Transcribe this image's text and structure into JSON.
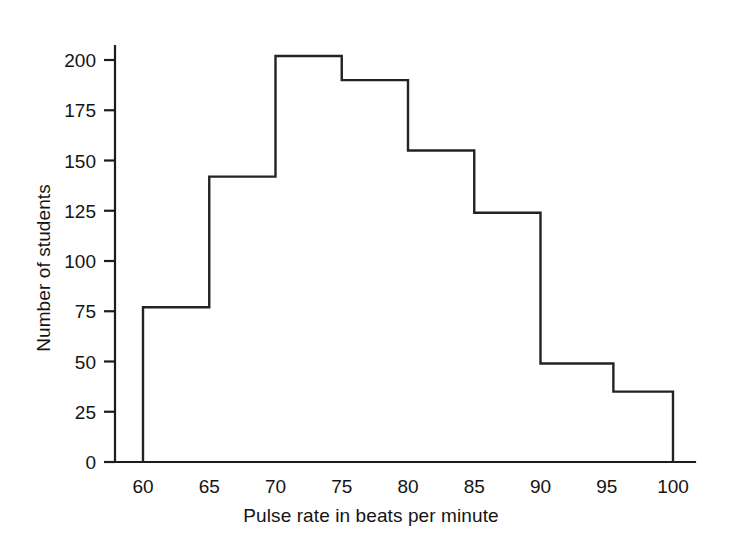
{
  "chart_data": {
    "type": "bar",
    "title": "",
    "subtitle": "",
    "xlabel": "Pulse rate in beats per minute",
    "ylabel": "Number of students",
    "style": "histogram-outline",
    "grid": false,
    "legend": null,
    "xlim": [
      57,
      103
    ],
    "ylim": [
      0,
      210
    ],
    "xticks": [
      60,
      65,
      70,
      75,
      80,
      85,
      90,
      95,
      100
    ],
    "xtick_labels": [
      "60",
      "65",
      "70",
      "75",
      "80",
      "85",
      "90",
      "95",
      "100"
    ],
    "yticks": [
      0,
      25,
      50,
      75,
      100,
      125,
      150,
      175,
      200
    ],
    "ytick_labels": [
      "0",
      "25",
      "50",
      "75",
      "100",
      "125",
      "150",
      "175",
      "200"
    ],
    "bin_edges": [
      60,
      65,
      70,
      75,
      80,
      85,
      90,
      95.5,
      100
    ],
    "categories": [
      "60-65",
      "65-70",
      "70-75",
      "75-80",
      "80-85",
      "85-90",
      "90-95.5",
      "95.5-100"
    ],
    "values": [
      77,
      142,
      202,
      190,
      155,
      124,
      49,
      35
    ],
    "line_color": "#232323",
    "fill_color": "none",
    "axis_color": "#1c1c1c"
  },
  "axes": {
    "x_title": "Pulse rate in beats per minute",
    "y_title": "Number of students"
  }
}
